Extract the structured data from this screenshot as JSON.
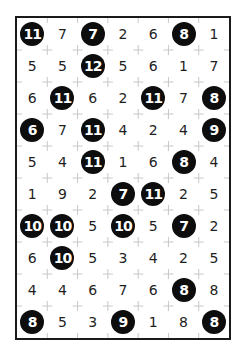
{
  "puzzle": {
    "type": "hitori",
    "rows": 10,
    "cols": 7,
    "colors": {
      "border": "#1a1a1a",
      "grid_mark": "#c8c8c8",
      "shaded_fill": "#0d0d0d",
      "shaded_text": "#ffffff",
      "text": "#1e1e1e"
    },
    "grid": [
      [
        11,
        7,
        7,
        2,
        6,
        8,
        1
      ],
      [
        5,
        5,
        12,
        5,
        6,
        1,
        7
      ],
      [
        6,
        11,
        6,
        2,
        11,
        7,
        8
      ],
      [
        6,
        7,
        11,
        4,
        2,
        4,
        9
      ],
      [
        5,
        4,
        11,
        1,
        6,
        8,
        4
      ],
      [
        1,
        9,
        2,
        7,
        11,
        2,
        5
      ],
      [
        10,
        10,
        5,
        10,
        5,
        7,
        2
      ],
      [
        6,
        10,
        5,
        3,
        4,
        2,
        5
      ],
      [
        4,
        4,
        6,
        7,
        6,
        8,
        8
      ],
      [
        8,
        5,
        3,
        9,
        1,
        8,
        8
      ]
    ],
    "shaded": [
      [
        1,
        0,
        1,
        0,
        0,
        1,
        0
      ],
      [
        0,
        0,
        1,
        0,
        0,
        0,
        0
      ],
      [
        0,
        1,
        0,
        0,
        1,
        0,
        1
      ],
      [
        1,
        0,
        1,
        0,
        0,
        0,
        1
      ],
      [
        0,
        0,
        1,
        0,
        0,
        1,
        0
      ],
      [
        0,
        0,
        0,
        1,
        1,
        0,
        0
      ],
      [
        1,
        1,
        0,
        1,
        0,
        1,
        0
      ],
      [
        0,
        1,
        0,
        0,
        0,
        0,
        0
      ],
      [
        0,
        0,
        0,
        0,
        0,
        1,
        0
      ],
      [
        1,
        0,
        0,
        1,
        0,
        0,
        1
      ]
    ]
  }
}
